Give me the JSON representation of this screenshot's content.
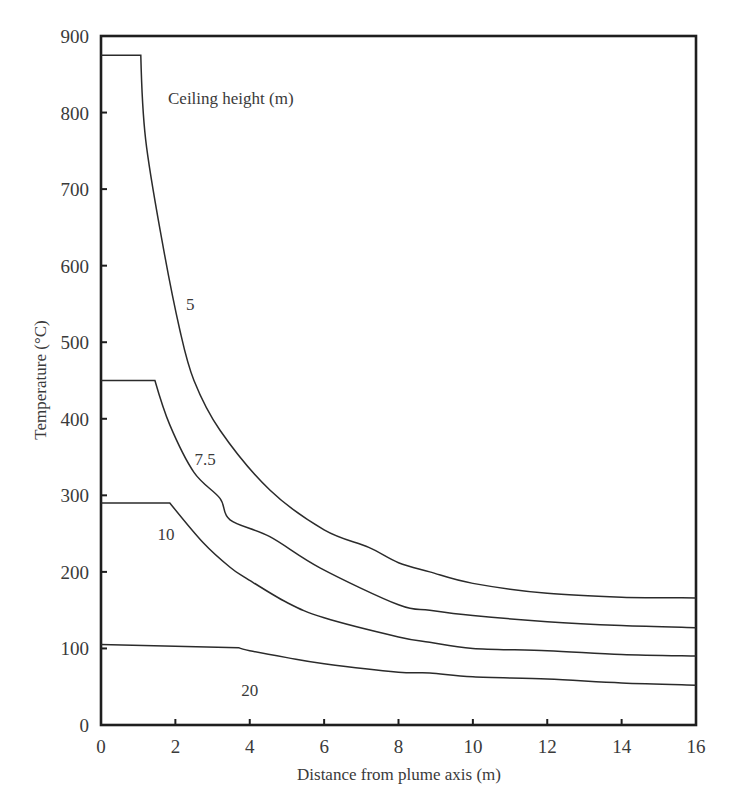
{
  "chart_data": {
    "type": "line",
    "title": "",
    "xlabel": "Distance from plume axis (m)",
    "ylabel": "Temperature (°C)",
    "xlim": [
      0,
      16
    ],
    "ylim": [
      0,
      900
    ],
    "xticks": [
      0,
      2,
      4,
      6,
      8,
      10,
      12,
      14,
      16
    ],
    "yticks": [
      0,
      100,
      200,
      300,
      400,
      500,
      600,
      700,
      800,
      900
    ],
    "grid": false,
    "legend": {
      "title": "Ceiling height (m)",
      "position": "upper-left-inside"
    },
    "series": [
      {
        "name": "5",
        "label_pos": [
          2.4,
          550
        ],
        "x": [
          0,
          1.07,
          1.2,
          1.64,
          2.12,
          2.5,
          3.2,
          4.54,
          6,
          7.2,
          8,
          8.84,
          10,
          12,
          14,
          16
        ],
        "y": [
          875,
          875,
          765,
          633,
          516,
          450,
          385,
          307,
          255,
          232,
          212,
          200,
          185,
          172,
          167,
          166
        ]
      },
      {
        "name": "7.5",
        "label_pos": [
          2.8,
          348
        ],
        "x": [
          0,
          1.45,
          1.85,
          2.5,
          3.2,
          3.47,
          4.54,
          5.9,
          8,
          8.84,
          10,
          12,
          14,
          16
        ],
        "y": [
          450,
          450,
          392,
          330,
          296,
          268,
          246,
          205,
          157,
          150,
          143,
          135,
          130,
          127
        ]
      },
      {
        "name": "10",
        "label_pos": [
          1.75,
          250
        ],
        "x": [
          0,
          1.85,
          2.75,
          3.47,
          3.9,
          5,
          6,
          8,
          8.84,
          10,
          12,
          14,
          16
        ],
        "y": [
          290,
          290,
          238,
          206,
          192,
          160,
          140,
          115,
          108,
          100,
          97,
          92,
          90
        ]
      },
      {
        "name": "20",
        "label_pos": [
          4.0,
          46
        ],
        "x": [
          0,
          3.7,
          4,
          5,
          6,
          8,
          8.84,
          10,
          12,
          14,
          16
        ],
        "y": [
          105,
          101,
          97,
          88,
          80,
          69,
          68,
          63,
          60,
          55,
          52
        ]
      }
    ]
  },
  "colors": {
    "line": "#2b2b2b",
    "axis": "#1e1e1e",
    "text": "#3a3a3a"
  }
}
